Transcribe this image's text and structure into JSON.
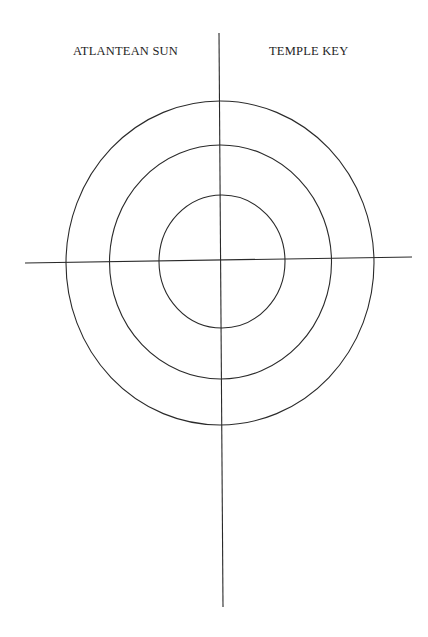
{
  "labels": {
    "left": "ATLANTEAN SUN",
    "right": "TEMPLE KEY"
  },
  "diagram": {
    "type": "concentric-circles-with-crosshair",
    "center": [
      221,
      262
    ],
    "circles": [
      {
        "name": "inner",
        "rx": 63,
        "ry": 66
      },
      {
        "name": "middle",
        "rx": 111,
        "ry": 117
      },
      {
        "name": "outer",
        "rx": 154,
        "ry": 162
      }
    ],
    "vertical_axis": {
      "x1": 219,
      "y1": 33,
      "x2": 223,
      "y2": 607
    },
    "horizontal_axis": {
      "x1": 25,
      "y1": 263,
      "x2": 412,
      "y2": 257
    },
    "stroke_color": "#2a2a2a",
    "background": "#ffffff"
  }
}
